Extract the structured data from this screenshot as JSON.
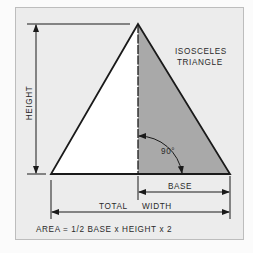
{
  "figure": {
    "title_line1": "ISOSCELES",
    "title_line2": "TRIANGLE",
    "labels": {
      "height": "HEIGHT",
      "base": "BASE",
      "total_width_part1": "TOTAL",
      "total_width_part2": "WIDTH",
      "angle": "90°"
    },
    "formula": "AREA = 1/2 BASE x HEIGHT x 2",
    "colors": {
      "panel_background": "#ececec",
      "panel_border": "#b8b8b8",
      "shaded_half": "#a9a9a9",
      "unshaded_half": "#ffffff",
      "line": "#1a1a1a"
    }
  }
}
